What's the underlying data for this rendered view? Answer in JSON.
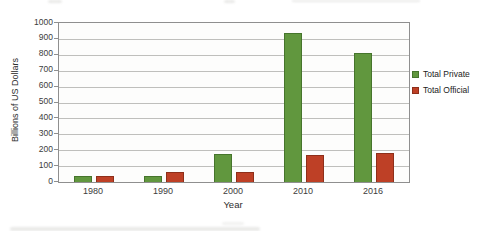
{
  "chart_data": {
    "type": "bar",
    "title": "",
    "categories": [
      "1980",
      "1990",
      "2000",
      "2010",
      "2016"
    ],
    "series": [
      {
        "name": "Total Private",
        "color": "#61973e",
        "border_color": "#46752c",
        "values": [
          40,
          40,
          175,
          940,
          810
        ]
      },
      {
        "name": "Total Official",
        "color": "#be4026",
        "border_color": "#8e2f1a",
        "values": [
          35,
          65,
          60,
          170,
          180
        ]
      }
    ],
    "xlabel": "Year",
    "ylabel": "Billions of US Dollars",
    "ylim": [
      0,
      1000
    ],
    "ytick_step": 100,
    "grid": true,
    "legend_position": "right",
    "colors": {
      "gridline": "#bfbfbc",
      "plot_border": "#8f8f8f",
      "tick_text": "#3c3c3c"
    }
  }
}
